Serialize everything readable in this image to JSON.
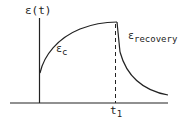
{
  "diagram": {
    "y_axis_label": "ε(t)",
    "x_axis_tick_label_base": "t",
    "x_axis_tick_label_sub": "1",
    "curve_labels": {
      "creep_symbol": "ε",
      "creep_sub": "c",
      "recovery_symbol": "ε",
      "recovery_sub": "recovery"
    },
    "colors": {
      "line": "#222222",
      "background": "#ffffff"
    }
  }
}
